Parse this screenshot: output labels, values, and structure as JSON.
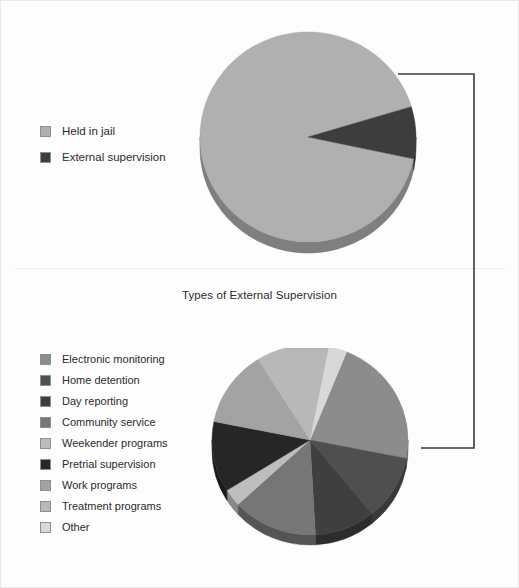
{
  "figure": {
    "background": "#fdfdfd",
    "width": 519,
    "height": 588
  },
  "panel_top": {
    "legend": {
      "items": [
        {
          "label": "Held in jail",
          "color": "#b0b0b0"
        },
        {
          "label": "External supervision",
          "color": "#3d3d3d"
        }
      ]
    }
  },
  "panel_bottom": {
    "title": "Types of External Supervision",
    "legend": {
      "items": [
        {
          "label": "Electronic monitoring",
          "color": "#8c8c8c"
        },
        {
          "label": "Home detention",
          "color": "#4f4f4f"
        },
        {
          "label": "Day reporting",
          "color": "#3f3f3f"
        },
        {
          "label": "Community service",
          "color": "#767676"
        },
        {
          "label": "Weekender programs",
          "color": "#bdbdbd"
        },
        {
          "label": "Pretrial supervision",
          "color": "#262626"
        },
        {
          "label": "Work programs",
          "color": "#a3a3a3"
        },
        {
          "label": "Treatment programs",
          "color": "#b8b8b8"
        },
        {
          "label": "Other",
          "color": "#d8d8d8"
        }
      ]
    }
  },
  "connector": {
    "color": "#3a3a3a",
    "description": "bracket linking External supervision slice to lower pie"
  },
  "chart_data": [
    {
      "id": "jail-population-pie",
      "type": "pie",
      "title": "",
      "labels": [
        "Held in jail",
        "External supervision"
      ],
      "values": [
        92,
        8
      ],
      "unit": "percent",
      "colors": [
        "#b0b0b0",
        "#3d3d3d"
      ],
      "legend_position": "left",
      "three_d": true,
      "start_angle_deg": 12,
      "center": [
        307,
        137
      ],
      "radius": 110,
      "depth": 11
    },
    {
      "id": "external-supervision-types-pie",
      "type": "pie",
      "title": "Types of External Supervision",
      "labels": [
        "Electronic monitoring",
        "Home detention",
        "Day reporting",
        "Community service",
        "Weekender programs",
        "Pretrial supervision",
        "Work programs",
        "Treatment programs",
        "Other"
      ],
      "values": [
        22,
        11,
        10,
        14,
        3,
        12,
        13,
        12,
        3
      ],
      "unit": "percent",
      "colors": [
        "#8c8c8c",
        "#4f4f4f",
        "#3f3f3f",
        "#767676",
        "#bdbdbd",
        "#262626",
        "#a3a3a3",
        "#b8b8b8",
        "#d8d8d8"
      ],
      "legend_position": "left",
      "three_d": true,
      "start_angle_deg": -68,
      "center": [
        310,
        438
      ],
      "radius": 100,
      "depth": 10
    }
  ]
}
